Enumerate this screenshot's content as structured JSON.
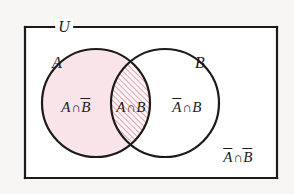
{
  "figure": {
    "type": "venn-diagram",
    "sets": [
      "A",
      "B"
    ],
    "universe_label": "U",
    "background_color": "#f7f6f4",
    "universe_fill": "#ffffff",
    "stroke_color": "#1d1b1a",
    "region_a_only_fill": "#f8e4e9",
    "intersection_hatch_color": "#d98a96",
    "intersection_hatch_angle_deg": 45,
    "intersection_fill": "#fdf6f7"
  },
  "labels": {
    "universe": "U",
    "circle_a": "A",
    "circle_b": "B",
    "a_not_b": {
      "left": "A",
      "cap": "∩",
      "right": "B",
      "right_bar": true,
      "left_bar": false,
      "text": "A∩B̄"
    },
    "a_and_b": {
      "left": "A",
      "cap": "∩",
      "right": "B",
      "right_bar": false,
      "left_bar": false,
      "text": "A∩B"
    },
    "not_a_b": {
      "left": "A",
      "cap": "∩",
      "right": "B",
      "right_bar": false,
      "left_bar": true,
      "text": "Ā∩B"
    },
    "not_a_not_b": {
      "left": "A",
      "cap": "∩",
      "right": "B",
      "right_bar": true,
      "left_bar": true,
      "text": "Ā∩B̄"
    }
  },
  "geometry": {
    "rect": {
      "x": 25,
      "y": 27,
      "width": 252,
      "height": 151
    },
    "circle_a": {
      "cx": 96,
      "cy": 103,
      "r": 54
    },
    "circle_b": {
      "cx": 165,
      "cy": 103,
      "r": 54
    }
  }
}
